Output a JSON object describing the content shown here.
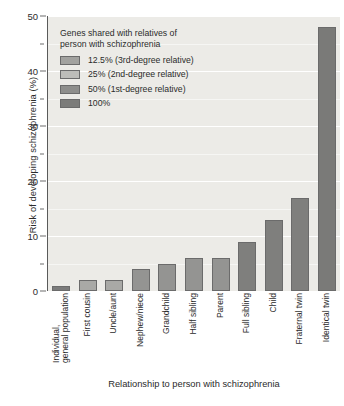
{
  "chart_data": {
    "type": "bar",
    "title": "",
    "xlabel": "Relationship to person with schizophrenia",
    "ylabel": "Risk of developing schizophrenia (%)",
    "ylim": [
      0,
      50
    ],
    "ytick_values": [
      0,
      10,
      20,
      30,
      40,
      50
    ],
    "ytick_labels": [
      "0",
      "10",
      "20",
      "30",
      "40",
      "50"
    ],
    "yminor_values": [
      5,
      15,
      25,
      35,
      45
    ],
    "grid": "horizontal",
    "legend_position": "top-left-inside",
    "categories": [
      "Individual, general population",
      "First cousin",
      "Uncle/aunt",
      "Nephew/niece",
      "Grandchild",
      "Half sibling",
      "Parent",
      "Full sibling",
      "Child",
      "Fraternal twin",
      "Identical twin"
    ],
    "category_lines": [
      [
        "Individual,",
        "general population"
      ],
      [
        "First cousin"
      ],
      [
        "Uncle/aunt"
      ],
      [
        "Nephew/niece"
      ],
      [
        "Grandchild"
      ],
      [
        "Half sibling"
      ],
      [
        "Parent"
      ],
      [
        "Full sibling"
      ],
      [
        "Child"
      ],
      [
        "Fraternal twin"
      ],
      [
        "Identical twin"
      ]
    ],
    "values": [
      1,
      2,
      2,
      4,
      5,
      6,
      6,
      9,
      13,
      17,
      48
    ],
    "bar_colors": [
      "#7b7b7b",
      "#a9a9a6",
      "#a9a9a6",
      "#949492",
      "#949492",
      "#949492",
      "#949492",
      "#7f7f7d",
      "#7f7f7d",
      "#7f7f7d",
      "#7a7a78"
    ],
    "plot_background": "#ecebe7",
    "gridline_color": "#ffffff",
    "axis_color": "#5a5a5a"
  },
  "legend": {
    "title": "Genes shared with relatives of person with schizophrenia",
    "title_lines": [
      "Genes shared with relatives of",
      "person with schizophrenia"
    ],
    "entries": [
      {
        "label": "12.5% (3rd-degree relative)",
        "color": "#a2a29f"
      },
      {
        "label": "25% (2nd-degree relative)",
        "color": "#bdbdb9"
      },
      {
        "label": "50% (1st-degree relative)",
        "color": "#8e8e8c"
      },
      {
        "label": "100%",
        "color": "#7c7c7a"
      }
    ]
  }
}
